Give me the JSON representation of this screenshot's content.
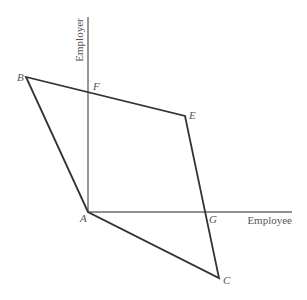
{
  "diagram": {
    "axes": {
      "vertical": {
        "label": "Employer",
        "x": 88,
        "y_top": 17,
        "y_bottom": 212
      },
      "horizontal": {
        "label": "Employee",
        "y": 212,
        "x_left": 88,
        "x_right": 292
      }
    },
    "points": {
      "A": {
        "label": "A",
        "x": 88,
        "y": 212,
        "label_x": 80,
        "label_y": 222
      },
      "B": {
        "label": "B",
        "x": 26,
        "y": 77,
        "label_x": 17,
        "label_y": 81
      },
      "C": {
        "label": "C",
        "x": 219,
        "y": 278,
        "label_x": 223,
        "label_y": 284
      },
      "E": {
        "label": "E",
        "x": 185,
        "y": 116,
        "label_x": 189,
        "label_y": 119
      },
      "F": {
        "label": "F",
        "x": 88,
        "y": 93,
        "label_x": 93,
        "label_y": 90
      },
      "G": {
        "label": "G",
        "x": 206,
        "y": 212,
        "label_x": 209,
        "label_y": 223
      }
    },
    "polygon": [
      "A",
      "B",
      "E",
      "C"
    ],
    "colors": {
      "axis": "#6b6b6b",
      "edge": "#333333",
      "text": "#555555",
      "background": "#ffffff"
    }
  }
}
